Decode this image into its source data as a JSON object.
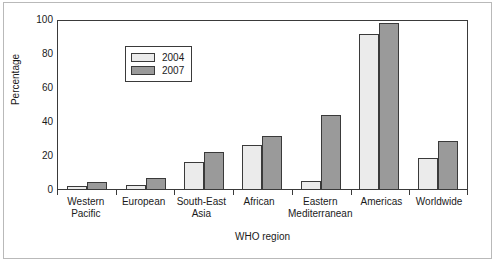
{
  "chart_data": {
    "type": "bar",
    "title": "",
    "subtitle": "",
    "xlabel": "WHO region",
    "ylabel": "Percentage",
    "ylim": [
      0,
      100
    ],
    "yticks": [
      0,
      20,
      40,
      60,
      80,
      100
    ],
    "grid": false,
    "legend_position": "top-left-inside",
    "categories": [
      "Western Pacific",
      "European",
      "South-East Asia",
      "African",
      "Eastern Mediterranean",
      "Americas",
      "Worldwide"
    ],
    "category_lines": [
      [
        "Western",
        "Pacific"
      ],
      [
        "European"
      ],
      [
        "South-East",
        "Asia"
      ],
      [
        "African"
      ],
      [
        "Eastern",
        "Mediterranean"
      ],
      [
        "Americas"
      ],
      [
        "Worldwide"
      ]
    ],
    "series": [
      {
        "name": "2004",
        "color": "#ebebeb",
        "values": [
          2,
          2.5,
          16,
          26,
          5,
          91,
          18
        ]
      },
      {
        "name": "2007",
        "color": "#9a9a9a",
        "values": [
          4,
          6.5,
          21.5,
          31,
          43.5,
          97.5,
          28
        ]
      }
    ]
  },
  "axes": {
    "y_title": "Percentage",
    "x_title": "WHO region",
    "y_tick_labels": [
      "0",
      "20",
      "40",
      "60",
      "80",
      "100"
    ]
  },
  "legend": {
    "entries": [
      {
        "label": "2004"
      },
      {
        "label": "2007"
      }
    ]
  },
  "colors": {
    "series_2004": "#ebebeb",
    "series_2007": "#9a9a9a",
    "axis": "#3a3a3a",
    "frame": "#b9b9b9",
    "text": "#1a1a1a",
    "background": "#ffffff"
  }
}
